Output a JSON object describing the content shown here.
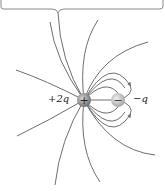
{
  "diagram": {
    "type": "electric-field-lines",
    "charges": [
      {
        "label": "+2q",
        "sign": "+",
        "x": 84,
        "y": 100,
        "color": "#8c8c8c"
      },
      {
        "label": "−q",
        "sign": "−",
        "x": 118,
        "y": 100,
        "color": "#bdbdbd"
      }
    ],
    "line_color": "#6e6e6e",
    "frame_color": "#8a8a8a"
  }
}
